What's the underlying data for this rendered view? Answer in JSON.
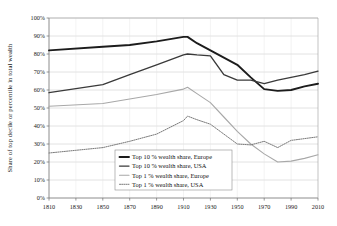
{
  "chart_data": {
    "type": "line",
    "title": "",
    "xlabel": "",
    "ylabel": "Share of top decile or percentile in total wealth",
    "xlim": [
      1810,
      2010
    ],
    "ylim": [
      0,
      100
    ],
    "grid": true,
    "legend_position": "inside-bottom-center",
    "x_ticks": [
      "1810",
      "1830",
      "1850",
      "1870",
      "1890",
      "1910",
      "1930",
      "1950",
      "1970",
      "1990",
      "2010"
    ],
    "y_ticks": [
      "0%",
      "10%",
      "20%",
      "30%",
      "40%",
      "50%",
      "60%",
      "70%",
      "80%",
      "90%",
      "100%"
    ],
    "series": [
      {
        "name": "Top 10 % wealth share, Europe",
        "color": "#1c1c1c",
        "width": 1.9,
        "dash": "none",
        "x": [
          1810,
          1850,
          1870,
          1890,
          1910,
          1913,
          1920,
          1930,
          1950,
          1960,
          1970,
          1980,
          1990,
          2000,
          2010
        ],
        "values": [
          82,
          84,
          85,
          87,
          89.5,
          89.5,
          86,
          82,
          74,
          67,
          60.5,
          59.5,
          60,
          62,
          63.5
        ]
      },
      {
        "name": "Top 10 % wealth share, USA",
        "color": "#3a3a3a",
        "width": 1.35,
        "dash": "none",
        "x": [
          1810,
          1850,
          1870,
          1890,
          1910,
          1913,
          1920,
          1930,
          1940,
          1950,
          1960,
          1970,
          1980,
          1990,
          2000,
          2010
        ],
        "values": [
          58.5,
          63,
          68.5,
          74,
          79.5,
          80,
          79.5,
          79,
          68.5,
          65.5,
          65.5,
          63.5,
          65.5,
          67,
          68.5,
          70.5
        ]
      },
      {
        "name": "Top 1 % wealth share, Europe",
        "color": "#a8a8a8",
        "width": 1.1,
        "dash": "none",
        "x": [
          1810,
          1850,
          1870,
          1890,
          1910,
          1913,
          1920,
          1930,
          1940,
          1950,
          1960,
          1970,
          1980,
          1990,
          2000,
          2010
        ],
        "values": [
          51,
          52.5,
          55,
          57.5,
          60.5,
          61.5,
          58,
          53,
          45,
          37,
          30,
          24.5,
          20,
          20.5,
          22,
          24
        ]
      },
      {
        "name": "Top 1 % wealth share, USA",
        "color": "#7a7a7a",
        "width": 1.0,
        "dash": "dotted",
        "x": [
          1810,
          1830,
          1850,
          1870,
          1890,
          1910,
          1913,
          1920,
          1930,
          1940,
          1950,
          1960,
          1970,
          1980,
          1990,
          2000,
          2010
        ],
        "values": [
          25,
          26.5,
          28,
          31.5,
          35.5,
          43,
          45.5,
          43.5,
          41,
          35.5,
          30,
          29.5,
          31.5,
          28,
          32,
          33,
          34
        ]
      }
    ]
  },
  "legend": {
    "entries": [
      {
        "label": "Top 10 % wealth share, Europe"
      },
      {
        "label": "Top 10 % wealth share, USA"
      },
      {
        "label": "Top 1 % wealth share, Europe"
      },
      {
        "label": "Top 1 % wealth share, USA"
      }
    ]
  }
}
